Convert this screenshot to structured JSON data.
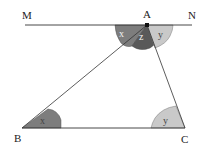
{
  "diagram": {
    "points": {
      "M": {
        "label": "M"
      },
      "N": {
        "label": "N"
      },
      "A": {
        "label": "A"
      },
      "B": {
        "label": "B"
      },
      "C": {
        "label": "C"
      }
    },
    "angles": {
      "A_left": {
        "label": "x"
      },
      "A_middle": {
        "label": "z"
      },
      "A_right": {
        "label": "y"
      },
      "B": {
        "label": "x"
      },
      "C": {
        "label": "y"
      }
    },
    "colors": {
      "angle_x": "#7d7d7d",
      "angle_z": "#595959",
      "angle_y": "#c9c9c9",
      "line": "#333333"
    }
  }
}
